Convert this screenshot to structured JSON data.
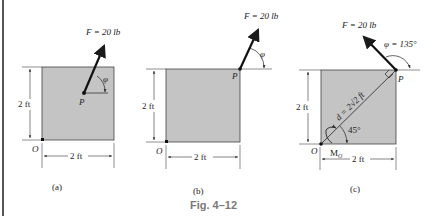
{
  "figure": {
    "caption": "Fig. 4–12",
    "panels": [
      {
        "label": "(a)",
        "force_label": "F = 20 lb",
        "point_label": "P",
        "origin_label": "O",
        "angle_label": "φ",
        "height_dim": "2 ft",
        "width_dim": "2 ft"
      },
      {
        "label": "(b)",
        "force_label": "F = 20 lb",
        "point_label": "P",
        "origin_label": "O",
        "angle_label": "φ",
        "height_dim": "2 ft",
        "width_dim": "2 ft"
      },
      {
        "label": "(c)",
        "force_label": "F = 20 lb",
        "point_label": "P",
        "origin_label": "O",
        "angle_label": "φ = 135°",
        "distance_label": "d = 2√2 ft",
        "diag_angle": "45°",
        "moment_label": "M",
        "moment_sub": "O",
        "height_dim": "2 ft",
        "width_dim": "2 ft"
      }
    ]
  },
  "colors": {
    "plate_fill": "#c4c4c4",
    "ink": "#1a1a1a",
    "caption": "#7a7a7a"
  }
}
